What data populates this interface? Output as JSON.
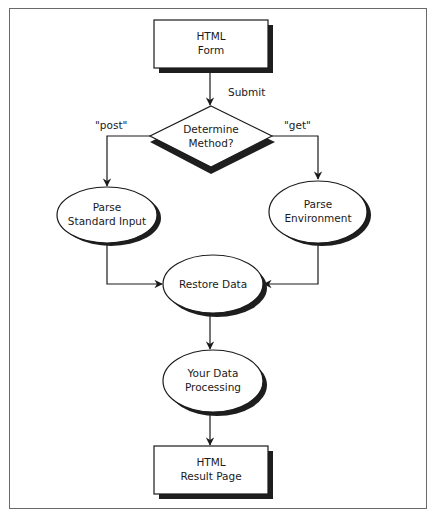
{
  "diagram": {
    "type": "flowchart",
    "title": "",
    "nodes": {
      "html_form": {
        "shape": "rectangle",
        "lines": [
          "HTML",
          "Form"
        ]
      },
      "determine_method": {
        "shape": "diamond",
        "lines": [
          "Determine",
          "Method?"
        ]
      },
      "parse_stdin": {
        "shape": "ellipse",
        "lines": [
          "Parse",
          "Standard Input"
        ]
      },
      "parse_env": {
        "shape": "ellipse",
        "lines": [
          "Parse",
          "Environment"
        ]
      },
      "restore_data": {
        "shape": "ellipse",
        "lines": [
          "Restore Data"
        ]
      },
      "your_processing": {
        "shape": "ellipse",
        "lines": [
          "Your Data",
          "Processing"
        ]
      },
      "html_result": {
        "shape": "rectangle",
        "lines": [
          "HTML",
          "Result Page"
        ]
      }
    },
    "edges": [
      {
        "from": "html_form",
        "to": "determine_method",
        "label": "Submit"
      },
      {
        "from": "determine_method",
        "to": "parse_stdin",
        "label": "\"post\""
      },
      {
        "from": "determine_method",
        "to": "parse_env",
        "label": "\"get\""
      },
      {
        "from": "parse_stdin",
        "to": "restore_data",
        "label": ""
      },
      {
        "from": "parse_env",
        "to": "restore_data",
        "label": ""
      },
      {
        "from": "restore_data",
        "to": "your_processing",
        "label": ""
      },
      {
        "from": "your_processing",
        "to": "html_result",
        "label": ""
      }
    ],
    "edge_labels": {
      "submit": "Submit",
      "post": "\"post\"",
      "get": "\"get\""
    },
    "colors": {
      "stroke": "#1a1a1a",
      "shadow": "#1e1e1e",
      "fill": "#ffffff",
      "frame": "#6a6a6a"
    }
  }
}
